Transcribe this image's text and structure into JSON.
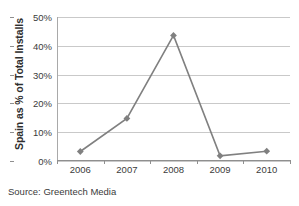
{
  "chart_data": {
    "type": "line",
    "title": "",
    "subtitle": "",
    "xlabel": "",
    "ylabel": "Spain as % of Total Installs",
    "categories": [
      "2006",
      "2007",
      "2008",
      "2009",
      "2010"
    ],
    "values": [
      3.3,
      14.8,
      43.6,
      1.8,
      3.4
    ],
    "series": [
      {
        "name": "Spain as % of Total Installs",
        "values": [
          3.3,
          14.8,
          43.6,
          1.8,
          3.4
        ]
      }
    ],
    "ylim": [
      0,
      50
    ],
    "y_ticks": [
      0,
      10,
      20,
      30,
      40,
      50
    ],
    "y_tick_labels": [
      "0%",
      "10%",
      "20%",
      "30%",
      "40%",
      "50%"
    ],
    "x_tick_labels": [
      "2006",
      "2007",
      "2008",
      "2009",
      "2010"
    ],
    "grid": "horizontal",
    "legend": "none",
    "marker": "diamond",
    "series_color": "#808080",
    "gridline_color": "#c9c9c9",
    "axis_color": "#8f8f8f",
    "background_color": "#ffffff"
  },
  "source_note": "Source: Greentech Media"
}
